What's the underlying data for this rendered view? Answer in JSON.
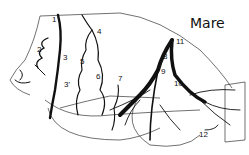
{
  "diagram": {
    "title": "Mare",
    "labels": [
      "1",
      "2",
      "3",
      "3'",
      "4",
      "5",
      "6",
      "7",
      "8",
      "9",
      "10",
      "11",
      "12"
    ],
    "stroke_color": "#111111",
    "background": "#ffffff"
  }
}
